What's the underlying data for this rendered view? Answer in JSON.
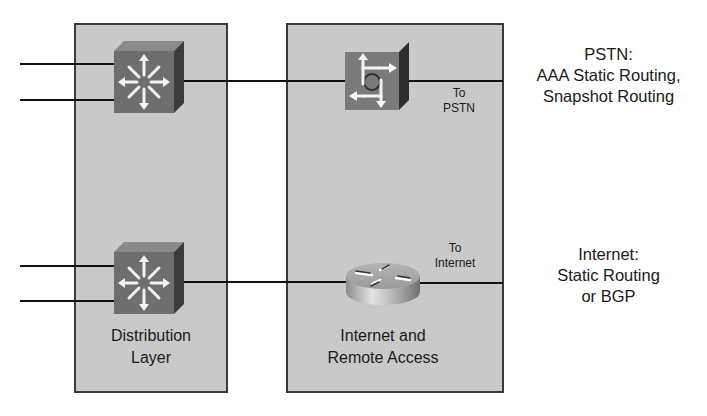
{
  "zones": [
    {
      "id": "distribution",
      "label_lines": [
        "Distribution",
        "Layer"
      ]
    },
    {
      "id": "internet-remote",
      "label_lines": [
        "Internet and",
        "Remote Access"
      ]
    }
  ],
  "devices": [
    {
      "id": "dist-switch-top",
      "type": "multilayer-switch"
    },
    {
      "id": "dist-switch-bottom",
      "type": "multilayer-switch"
    },
    {
      "id": "access-server",
      "type": "access-server"
    },
    {
      "id": "internet-router",
      "type": "router"
    }
  ],
  "links": {
    "pstn": {
      "label_lines": [
        "To",
        "PSTN"
      ]
    },
    "internet": {
      "label_lines": [
        "To",
        "Internet"
      ]
    }
  },
  "annotations": {
    "pstn": {
      "lines": [
        "PSTN:",
        "AAA Static Routing,",
        "Snapshot Routing"
      ]
    },
    "internet": {
      "lines": [
        "Internet:",
        "Static Routing",
        "or BGP"
      ]
    }
  },
  "colors": {
    "zone_fill": "#c9c9c9",
    "zone_border": "#3a3a3a",
    "device_face": "#6e6e6e",
    "device_side": "#3c3c3c",
    "line": "#111111"
  }
}
